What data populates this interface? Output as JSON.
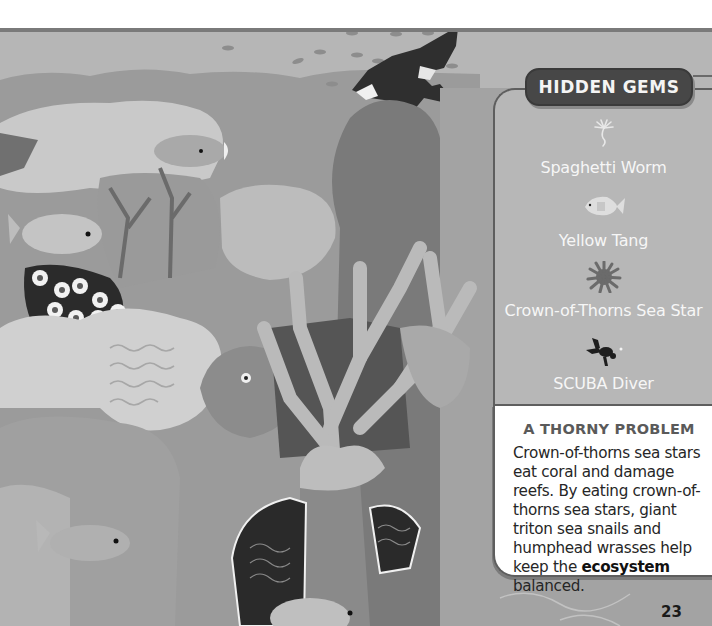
{
  "page": {
    "number": "23",
    "color_mode": "grayscale"
  },
  "illustration": {
    "subject": "coral reef scene",
    "elements": [
      "scuba diver",
      "school of small fish",
      "crown-of-thorns sea star",
      "yellow tang",
      "spaghetti worm",
      "giant clams",
      "staghorn coral",
      "humphead wrasse",
      "reef fish"
    ]
  },
  "hidden_gems": {
    "title": "HIDDEN GEMS",
    "items": [
      {
        "label": "Spaghetti Worm",
        "icon": "spaghetti-worm-icon"
      },
      {
        "label": "Yellow Tang",
        "icon": "yellow-tang-icon"
      },
      {
        "label": "Crown-of-Thorns Sea Star",
        "icon": "sea-star-icon"
      },
      {
        "label": "SCUBA Diver",
        "icon": "scuba-diver-icon"
      }
    ]
  },
  "info_box": {
    "title": "A THORNY PROBLEM",
    "body_before": "Crown-of-thorns sea stars eat coral and damage reefs. By eating crown-of-thorns sea stars, giant triton sea snails and humphead wrasses help keep the ",
    "body_bold": "ecosystem",
    "body_after": " balanced."
  },
  "colors": {
    "panel_bg": "#b7b7b7",
    "tab_bg": "#474747",
    "panel_border": "#5e5e5e",
    "info_bg": "#ffffff",
    "label_text": "#f6f6f6",
    "body_text": "#262626"
  }
}
